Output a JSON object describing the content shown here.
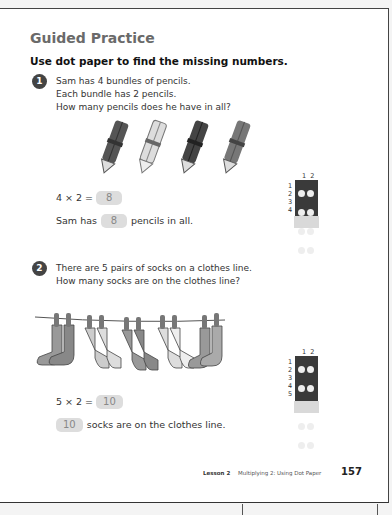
{
  "section_title": "Guided Practice",
  "instruction": "Use dot paper to find the missing numbers.",
  "problems": [
    {
      "number": "1",
      "question_lines": [
        "Sam has 4 bundles of pencils.",
        "Each bundle has 2 pencils.",
        "How many pencils does he have in all?"
      ],
      "equation_prefix": "4 × 2 =",
      "equation_answer": "8",
      "sentence_prefix": "Sam has",
      "sentence_answer": "8",
      "sentence_suffix": "pencils in all.",
      "illustration": "four-pencil-bundles",
      "dot_paper": {
        "cols": [
          "1",
          "2"
        ],
        "rows": [
          "1",
          "2",
          "3",
          "4"
        ]
      }
    },
    {
      "number": "2",
      "question_lines": [
        "There are 5 pairs of socks on a clothes line.",
        "How many socks are on the clothes line?"
      ],
      "equation_prefix": "5 × 2 =",
      "equation_answer": "10",
      "sentence_answer": "10",
      "sentence_suffix": "socks are on the clothes line.",
      "illustration": "socks-on-clothesline",
      "dot_paper": {
        "cols": [
          "1",
          "2"
        ],
        "rows": [
          "1",
          "2",
          "3",
          "4",
          "5"
        ]
      }
    }
  ],
  "footer": {
    "lesson": "Lesson 2",
    "lesson_title": "Multiplying 2: Using Dot Paper",
    "page_number": "157"
  }
}
